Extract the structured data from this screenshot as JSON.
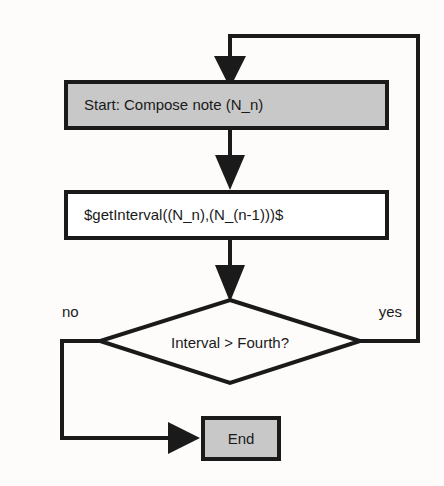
{
  "diagram": {
    "background_color": "#fdfcfa",
    "line_color": "#1a1a1a",
    "fill_gray": "#c8c8c8",
    "fill_white": "#ffffff"
  },
  "nodes": {
    "start": {
      "label": "Start: Compose note (N_n)",
      "shape": "rectangle",
      "fill": "#c8c8c8"
    },
    "process": {
      "label": "$getInterval((N_n),(N_(n-1)))$",
      "shape": "rectangle",
      "fill": "#ffffff"
    },
    "decision": {
      "label": "Interval > Fourth?",
      "shape": "diamond",
      "fill": "#fdfcfa"
    },
    "end": {
      "label": "End",
      "shape": "rectangle",
      "fill": "#c8c8c8"
    }
  },
  "edges": {
    "loop_back": {
      "label": "",
      "from": "decision",
      "to": "start"
    },
    "start_to_process": {
      "label": "",
      "from": "start",
      "to": "process"
    },
    "process_to_decision": {
      "label": "",
      "from": "process",
      "to": "decision"
    },
    "decision_no": {
      "label": "no",
      "from": "decision",
      "to": "end"
    },
    "decision_yes": {
      "label": "yes",
      "from": "decision",
      "to": "start"
    }
  }
}
